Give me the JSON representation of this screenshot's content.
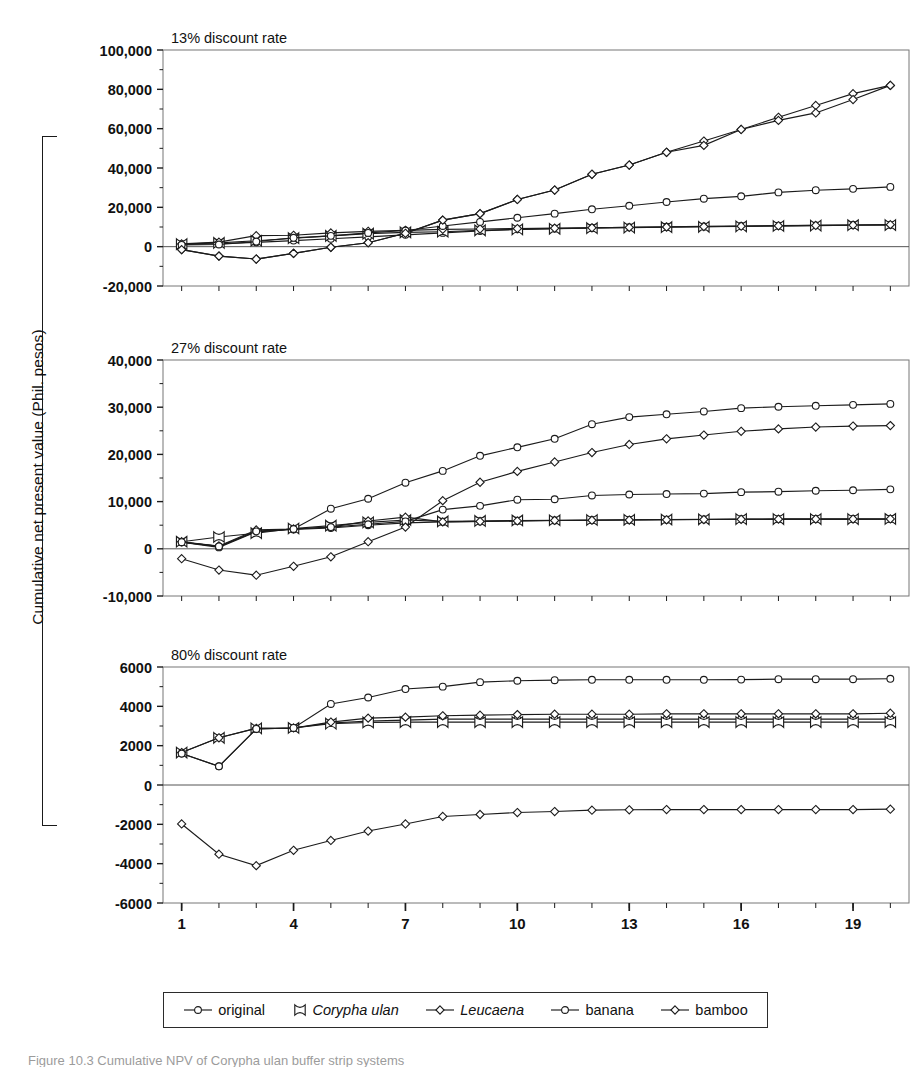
{
  "figure": {
    "y_axis_label": "Cumulative net present value (Phil. pesos)",
    "caption": "Figure 10.3  Cumulative NPV of Corypha ulan buffer strip systems"
  },
  "legend": {
    "items": [
      {
        "label": "original",
        "marker": "circle",
        "italic": false,
        "name": "legend-item-original"
      },
      {
        "label": "Corypha ulan",
        "marker": "x",
        "italic": true,
        "name": "legend-item-corypha-ulan"
      },
      {
        "label": "Leucaena",
        "marker": "diamond",
        "italic": true,
        "name": "legend-item-leucaena"
      },
      {
        "label": "banana",
        "marker": "circle",
        "italic": false,
        "name": "legend-item-banana"
      },
      {
        "label": "bamboo",
        "marker": "diamond",
        "italic": false,
        "name": "legend-item-bamboo"
      }
    ]
  },
  "chart_data": [
    {
      "type": "line",
      "id": "panel-13",
      "title": "13% discount rate",
      "xlabel": "",
      "ylabel": "Cumulative net present value (Phil. pesos)",
      "x": [
        1,
        2,
        3,
        4,
        5,
        6,
        7,
        8,
        9,
        10,
        11,
        12,
        13,
        14,
        15,
        16,
        17,
        18,
        19,
        20
      ],
      "xlim": [
        0.5,
        20.5
      ],
      "xticks": [
        1,
        4,
        7,
        10,
        13,
        16,
        19
      ],
      "xticklabels": [
        "1",
        "4",
        "7",
        "10",
        "13",
        "16",
        "19"
      ],
      "ylim": [
        -20000,
        100000
      ],
      "yticks": [
        -20000,
        0,
        20000,
        40000,
        60000,
        80000,
        100000
      ],
      "yticklabels": [
        "-20,000",
        "0",
        "20,000",
        "40,000",
        "60,000",
        "80,000",
        "100,000"
      ],
      "yminorstep": 10000,
      "grid": false,
      "zero_line": true,
      "series": [
        {
          "name": "original",
          "marker": "circle",
          "values": [
            1200,
            1500,
            2200,
            3100,
            4000,
            5000,
            6000,
            7000,
            8000,
            8800,
            9200,
            9600,
            9900,
            10100,
            10300,
            10500,
            10700,
            10850,
            11000,
            11100
          ]
        },
        {
          "name": "Corypha ulan",
          "marker": "x",
          "values": [
            1300,
            1900,
            3000,
            4300,
            5500,
            6600,
            7300,
            7600,
            8300,
            8800,
            9100,
            9400,
            9700,
            9900,
            10100,
            10300,
            10500,
            10700,
            10900,
            11000
          ]
        },
        {
          "name": "Leucaena",
          "marker": "diamond",
          "values": [
            1400,
            2300,
            5600,
            5800,
            7000,
            7800,
            8300,
            8800,
            9000,
            9200,
            9400,
            9600,
            9800,
            10000,
            10200,
            10400,
            10600,
            10800,
            11000,
            11200
          ]
        },
        {
          "name": "banana",
          "marker": "circle",
          "values": [
            900,
            1100,
            2600,
            4500,
            5500,
            7000,
            8200,
            10500,
            12600,
            14700,
            16800,
            19000,
            20800,
            22700,
            24400,
            25600,
            27600,
            28700,
            29400,
            30400
          ]
        },
        {
          "name": "bamboo",
          "marker": "diamond",
          "values": [
            -1500,
            -4800,
            -6300,
            -3400,
            -300,
            2000,
            6800,
            13500,
            16800,
            24000,
            28800,
            36800,
            41500,
            48000,
            51500,
            59600,
            64200,
            68000,
            74800,
            82000
          ]
        }
      ],
      "series_extra": [
        {
          "name": "bamboo-upper",
          "marker": "diamond",
          "values": [
            -1500,
            -4800,
            -6300,
            -3400,
            -300,
            2000,
            6800,
            13500,
            16800,
            24000,
            28800,
            36800,
            41500,
            48000,
            53700,
            59600,
            65800,
            71800,
            77800,
            82000
          ]
        }
      ]
    },
    {
      "type": "line",
      "id": "panel-27",
      "title": "27% discount rate",
      "xlabel": "",
      "ylabel": "Cumulative net present value (Phil. pesos)",
      "x": [
        1,
        2,
        3,
        4,
        5,
        6,
        7,
        8,
        9,
        10,
        11,
        12,
        13,
        14,
        15,
        16,
        17,
        18,
        19,
        20
      ],
      "xlim": [
        0.5,
        20.5
      ],
      "xticks": [
        1,
        4,
        7,
        10,
        13,
        16,
        19
      ],
      "xticklabels": [
        "1",
        "4",
        "7",
        "10",
        "13",
        "16",
        "19"
      ],
      "ylim": [
        -10000,
        40000
      ],
      "yticks": [
        -10000,
        0,
        10000,
        20000,
        30000,
        40000
      ],
      "yticklabels": [
        "-10,000",
        "0",
        "10,000",
        "20,000",
        "30,000",
        "40,000"
      ],
      "yminorstep": 5000,
      "grid": false,
      "zero_line": true,
      "series": [
        {
          "name": "original",
          "marker": "circle",
          "values": [
            1400,
            300,
            3600,
            4100,
            4400,
            5000,
            5500,
            5700,
            5800,
            5900,
            6000,
            6050,
            6100,
            6150,
            6200,
            6250,
            6280,
            6300,
            6300,
            6300
          ]
        },
        {
          "name": "Corypha ulan",
          "marker": "x",
          "values": [
            1500,
            2500,
            3300,
            4300,
            4900,
            5600,
            6100,
            5800,
            5900,
            6000,
            6050,
            6100,
            6150,
            6200,
            6250,
            6280,
            6300,
            6300,
            6300,
            6320
          ]
        },
        {
          "name": "Leucaena",
          "marker": "diamond",
          "values": [
            1500,
            600,
            4000,
            4200,
            4600,
            5900,
            6700,
            5700,
            5800,
            5900,
            6000,
            6050,
            6100,
            6150,
            6200,
            6250,
            6280,
            6300,
            6300,
            6320
          ]
        },
        {
          "name": "banana",
          "marker": "circle",
          "values": [
            1400,
            500,
            3700,
            4200,
            4600,
            5200,
            5800,
            8300,
            9100,
            10400,
            10500,
            11300,
            11500,
            11600,
            11700,
            12000,
            12100,
            12300,
            12400,
            12600
          ]
        },
        {
          "name": "bamboo",
          "marker": "diamond",
          "values": [
            -2100,
            -4500,
            -5600,
            -3700,
            -1700,
            1500,
            4600,
            10200,
            14100,
            16400,
            18400,
            20400,
            22100,
            23300,
            24100,
            24900,
            25400,
            25800,
            26000,
            26100
          ]
        }
      ],
      "series_extra": [
        {
          "name": "banana-upper",
          "marker": "circle",
          "values": [
            1400,
            500,
            3700,
            4200,
            8500,
            10600,
            14000,
            16500,
            19700,
            21500,
            23300,
            26400,
            27900,
            28500,
            29100,
            29800,
            30100,
            30300,
            30500,
            30700
          ]
        }
      ]
    },
    {
      "type": "line",
      "id": "panel-80",
      "title": "80% discount rate",
      "xlabel": "",
      "ylabel": "Cumulative net present value (Phil. pesos)",
      "x": [
        1,
        2,
        3,
        4,
        5,
        6,
        7,
        8,
        9,
        10,
        11,
        12,
        13,
        14,
        15,
        16,
        17,
        18,
        19,
        20
      ],
      "xlim": [
        0.5,
        20.5
      ],
      "xticks": [
        1,
        4,
        7,
        10,
        13,
        16,
        19
      ],
      "xticklabels": [
        "1",
        "4",
        "7",
        "10",
        "13",
        "16",
        "19"
      ],
      "ylim": [
        -6000,
        6000
      ],
      "yticks": [
        -6000,
        -4000,
        -2000,
        0,
        2000,
        4000,
        6000
      ],
      "yticklabels": [
        "-6000",
        "-4000",
        "-2000",
        "0",
        "2000",
        "4000",
        "6000"
      ],
      "yminorstep": 1000,
      "grid": false,
      "zero_line": true,
      "series": [
        {
          "name": "original",
          "marker": "circle",
          "values": [
            1600,
            950,
            2850,
            2900,
            3150,
            3250,
            3300,
            3350,
            3350,
            3350,
            3350,
            3350,
            3350,
            3350,
            3350,
            3350,
            3350,
            3350,
            3350,
            3350
          ]
        },
        {
          "name": "Corypha ulan",
          "marker": "x",
          "values": [
            1650,
            2400,
            2880,
            2900,
            3120,
            3180,
            3200,
            3200,
            3200,
            3200,
            3200,
            3200,
            3200,
            3200,
            3200,
            3200,
            3200,
            3200,
            3200,
            3200
          ]
        },
        {
          "name": "Leucaena",
          "marker": "diamond",
          "values": [
            1650,
            2400,
            2880,
            2900,
            3200,
            3400,
            3450,
            3520,
            3550,
            3580,
            3600,
            3600,
            3600,
            3620,
            3620,
            3620,
            3620,
            3620,
            3620,
            3650
          ]
        },
        {
          "name": "banana",
          "marker": "circle",
          "values": [
            1600,
            950,
            2850,
            2900,
            4120,
            4450,
            4880,
            5000,
            5230,
            5300,
            5330,
            5350,
            5350,
            5350,
            5350,
            5360,
            5380,
            5380,
            5380,
            5400
          ]
        },
        {
          "name": "bamboo",
          "marker": "diamond",
          "values": [
            -1980,
            -3520,
            -4100,
            -3320,
            -2820,
            -2340,
            -1980,
            -1600,
            -1500,
            -1400,
            -1350,
            -1280,
            -1260,
            -1250,
            -1250,
            -1250,
            -1250,
            -1250,
            -1250,
            -1230
          ]
        }
      ]
    }
  ]
}
